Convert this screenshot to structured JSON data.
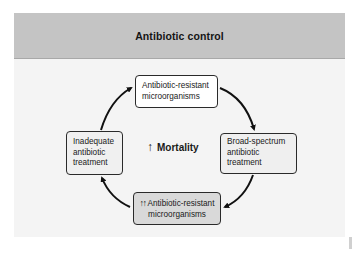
{
  "slide": {
    "title": "Antibiotic control",
    "colors": {
      "header_bg": "#c4c4c4",
      "slide_bg": "#f4f4f4",
      "highlight_box_bg": "#d9d9d9",
      "border": "#2a2a2a",
      "arrow": "#111111"
    }
  },
  "cycle": {
    "nodes": [
      {
        "id": "top",
        "lines": [
          "Antibiotic-resistant",
          "microorganisms"
        ]
      },
      {
        "id": "right",
        "lines": [
          "Broad-spectrum",
          "antibiotic",
          "treatment"
        ]
      },
      {
        "id": "bottom",
        "prefix": "↑↑",
        "lines": [
          "Antibiotic-resistant",
          "microorganisms"
        ]
      },
      {
        "id": "left",
        "lines": [
          "Inadequate",
          "antibiotic",
          "treatment"
        ]
      }
    ],
    "center": {
      "icon": "↑",
      "label": "Mortality"
    },
    "edges": [
      {
        "from": "left",
        "to": "top"
      },
      {
        "from": "top",
        "to": "right"
      },
      {
        "from": "right",
        "to": "bottom"
      },
      {
        "from": "bottom",
        "to": "left"
      }
    ]
  }
}
